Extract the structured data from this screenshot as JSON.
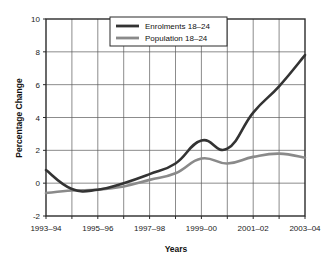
{
  "chart_data": {
    "type": "line",
    "title": "",
    "xlabel": "Years",
    "ylabel": "Percentage Change",
    "ylim": [
      -2,
      10
    ],
    "ytick_values": [
      -2,
      0,
      2,
      4,
      6,
      8,
      10
    ],
    "ytick_labels": [
      "-2",
      "0",
      "2",
      "4",
      "6",
      "8",
      "10"
    ],
    "grid": true,
    "legend_position": "top-center",
    "x": [
      "1993-94",
      "1994-95",
      "1995-96",
      "1996-97",
      "1997-98",
      "1998-99",
      "1999-00",
      "2000-01",
      "2001-02",
      "2002-03",
      "2003-04"
    ],
    "xtick_labels": [
      "1993–94",
      "1995–96",
      "1997–98",
      "1999–00",
      "2001–02",
      "2003–04"
    ],
    "xtick_label_indices": [
      0,
      2,
      4,
      6,
      8,
      10
    ],
    "series": [
      {
        "name": "Enrolments 18–24",
        "color": "#333333",
        "width": 2.6,
        "values": [
          0.8,
          -0.35,
          -0.4,
          0.0,
          0.55,
          1.2,
          2.6,
          2.1,
          4.3,
          5.9,
          7.8
        ]
      },
      {
        "name": "Population 18–24",
        "color": "#8a8a8a",
        "width": 2.6,
        "values": [
          -0.6,
          -0.45,
          -0.4,
          -0.2,
          0.2,
          0.6,
          1.5,
          1.2,
          1.6,
          1.8,
          1.55
        ]
      }
    ]
  },
  "legend": {
    "entries": [
      {
        "label": "Enrolments 18–24",
        "color": "#333333"
      },
      {
        "label": "Population 18–24",
        "color": "#8a8a8a"
      }
    ]
  },
  "axes": {
    "y_title": "Percentage Change",
    "x_title": "Years"
  }
}
